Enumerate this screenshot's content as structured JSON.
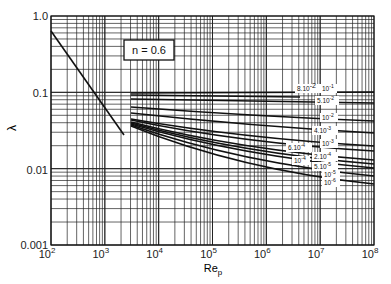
{
  "chart_data": {
    "type": "line",
    "title": "",
    "xlabel": "Re_p",
    "ylabel": "λ",
    "xscale": "log",
    "yscale": "log",
    "xlim": [
      100,
      100000000
    ],
    "ylim": [
      0.001,
      1.0
    ],
    "grid": true,
    "annotation": "n = 0.6",
    "x_ticks": [
      "10^2",
      "10^3",
      "10^4",
      "10^5",
      "10^6",
      "10^7",
      "10^8"
    ],
    "y_ticks": [
      "0.001",
      "0.01",
      "0.1",
      "1.0"
    ],
    "series": [
      {
        "name": "laminar",
        "points": [
          [
            100,
            0.64
          ],
          [
            2100,
            0.03
          ]
        ]
      },
      {
        "name": "10^-1",
        "label": "10⁻¹",
        "points": [
          [
            3000,
            0.1
          ],
          [
            100000000,
            0.1
          ]
        ]
      },
      {
        "name": "8·10^-2",
        "label": "8.10⁻²",
        "points": [
          [
            3000,
            0.095
          ],
          [
            100000000,
            0.09
          ]
        ]
      },
      {
        "name": "5·10^-2",
        "label": "5.10⁻²",
        "points": [
          [
            3000,
            0.085
          ],
          [
            100000000,
            0.075
          ]
        ]
      },
      {
        "name": "10^-2",
        "label": "10⁻²",
        "points": [
          [
            3000,
            0.065
          ],
          [
            100000000,
            0.044
          ]
        ]
      },
      {
        "name": "4·10^-3",
        "label": "4.10⁻³",
        "points": [
          [
            3000,
            0.055
          ],
          [
            100000000,
            0.031
          ]
        ]
      },
      {
        "name": "10^-3",
        "label": "10⁻³",
        "points": [
          [
            3000,
            0.045
          ],
          [
            100000000,
            0.021
          ]
        ]
      },
      {
        "name": "6·10^-4",
        "label": "6.10⁻⁴",
        "points": [
          [
            3000,
            0.043
          ],
          [
            100000000,
            0.018
          ]
        ]
      },
      {
        "name": "2·10^-4",
        "label": "2.10⁻⁴",
        "points": [
          [
            3000,
            0.041
          ],
          [
            100000000,
            0.014
          ]
        ]
      },
      {
        "name": "10^-4",
        "label": "10⁻⁴",
        "points": [
          [
            3000,
            0.04
          ],
          [
            100000000,
            0.0125
          ]
        ]
      },
      {
        "name": "5·10^-5",
        "label": "5.10⁻⁵",
        "points": [
          [
            3000,
            0.039
          ],
          [
            100000000,
            0.011
          ]
        ]
      },
      {
        "name": "10^-5",
        "label": "10⁻⁵",
        "points": [
          [
            3000,
            0.038
          ],
          [
            100000000,
            0.0087
          ]
        ]
      },
      {
        "name": "10^-6",
        "label": "10⁻⁶",
        "points": [
          [
            3000,
            0.037
          ],
          [
            100000000,
            0.0068
          ]
        ]
      }
    ]
  },
  "labels": {
    "y_axis": "λ",
    "x_axis_main": "Re",
    "x_axis_sub": "p",
    "annotation": "n = 0.6",
    "y_ticks": [
      "1.0",
      "0.1",
      "0.01",
      "0.001"
    ],
    "x_tick_base": "10",
    "x_tick_exps": [
      "2",
      "3",
      "4",
      "5",
      "6",
      "7",
      "8"
    ],
    "curve_labels": {
      "c1": "10",
      "c1e": "-1",
      "c2": "8.10",
      "c2e": "-2",
      "c3": "5.10",
      "c3e": "-2",
      "c4": "10",
      "c4e": "-2",
      "c5": "4.10",
      "c5e": "-3",
      "c6": "10",
      "c6e": "-3",
      "c7": "6.10",
      "c7e": "-4",
      "c8": "2.10",
      "c8e": "-4",
      "c9": "10",
      "c9e": "-4",
      "c10": "5.10",
      "c10e": "-5",
      "c11": "10",
      "c11e": "-5",
      "c12": "10",
      "c12e": "-6"
    }
  }
}
